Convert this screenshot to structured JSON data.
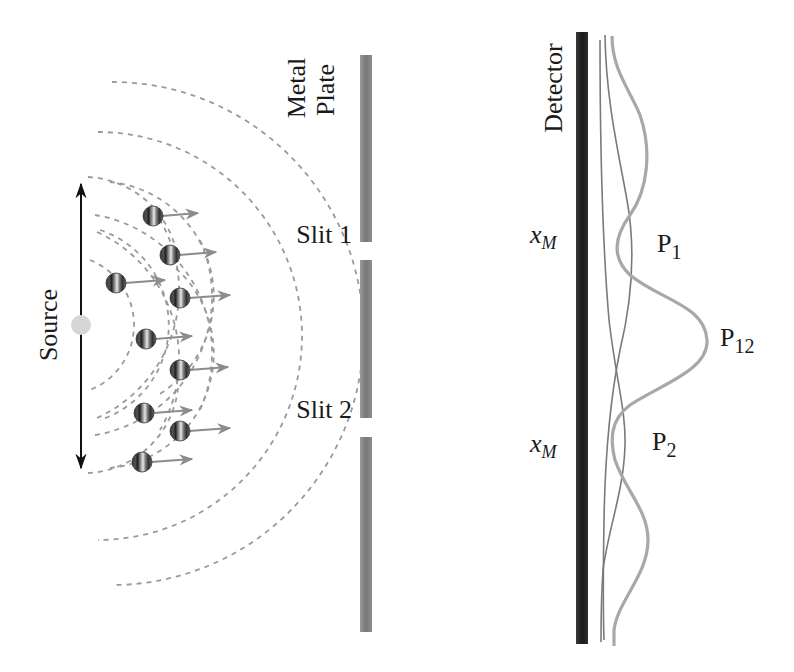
{
  "colors": {
    "wave": "#9a9a9a",
    "particle_arrow": "#8c8c8c",
    "plate": "#7f7f7f",
    "detector": "#2a2a2a",
    "p_single": "#7a7a7a",
    "p12": "#a8a8a8",
    "source_dot": "#d6d6d6",
    "text": "#1a1a1a"
  },
  "labels": {
    "source": "Source",
    "metal_plate_line1": "Metal",
    "metal_plate_line2": "Plate",
    "slit1": "Slit 1",
    "slit2": "Slit 2",
    "detector": "Detector",
    "xm_top_main": "x",
    "xm_top_sub": "M",
    "xm_bottom_main": "x",
    "xm_bottom_sub": "M",
    "p1_main": "P",
    "p1_sub": "1",
    "p2_main": "P",
    "p2_sub": "2",
    "p12_main": "P",
    "p12_sub": "12"
  },
  "particles": [
    {
      "x": 153,
      "y": 216,
      "arrow_to": 198
    },
    {
      "x": 170,
      "y": 255,
      "arrow_to": 216
    },
    {
      "x": 116,
      "y": 283,
      "arrow_to": 165
    },
    {
      "x": 180,
      "y": 298,
      "arrow_to": 230
    },
    {
      "x": 146,
      "y": 339,
      "arrow_to": 192
    },
    {
      "x": 180,
      "y": 370,
      "arrow_to": 228
    },
    {
      "x": 144,
      "y": 413,
      "arrow_to": 192
    },
    {
      "x": 180,
      "y": 431,
      "arrow_to": 230
    },
    {
      "x": 142,
      "y": 462,
      "arrow_to": 192
    }
  ],
  "plate_segments": [
    {
      "y1": 55,
      "y2": 242
    },
    {
      "y1": 260,
      "y2": 418
    },
    {
      "y1": 437,
      "y2": 632
    }
  ]
}
